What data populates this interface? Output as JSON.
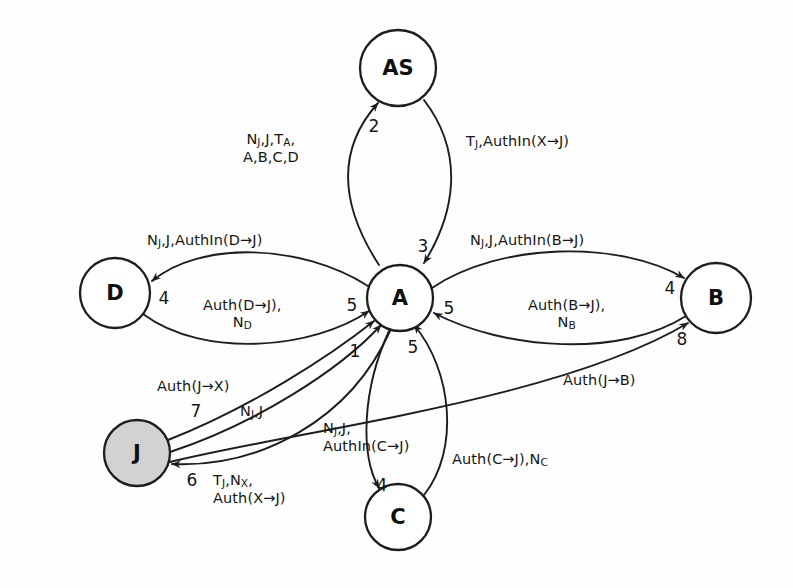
{
  "diagram": {
    "background_color": "#fefefe",
    "stroke_color": "#1d1d1d",
    "shaded_node_color": "#d2d2d2",
    "nodes": [
      {
        "id": "AS",
        "label": "AS",
        "cx": 398,
        "cy": 68,
        "r": 38,
        "shaded": false
      },
      {
        "id": "A",
        "label": "A",
        "cx": 400,
        "cy": 298,
        "r": 33,
        "shaded": false
      },
      {
        "id": "D",
        "label": "D",
        "cx": 115,
        "cy": 293,
        "r": 35,
        "shaded": false
      },
      {
        "id": "B",
        "label": "B",
        "cx": 716,
        "cy": 298,
        "r": 35,
        "shaded": false
      },
      {
        "id": "J",
        "label": "J",
        "cx": 137,
        "cy": 453,
        "r": 33,
        "shaded": true
      },
      {
        "id": "C",
        "label": "C",
        "cx": 398,
        "cy": 517,
        "r": 33,
        "shaded": false
      }
    ],
    "step_numbers": [
      {
        "id": "step-2-a-to-as",
        "text": "2",
        "x": 374,
        "y": 127
      },
      {
        "id": "step-3-as-to-a",
        "text": "3",
        "x": 423,
        "y": 247
      },
      {
        "id": "step-4-a-to-d",
        "text": "4",
        "x": 164,
        "y": 299
      },
      {
        "id": "step-5-d-to-a",
        "text": "5",
        "x": 352,
        "y": 306
      },
      {
        "id": "step-4-a-to-b",
        "text": "4",
        "x": 670,
        "y": 289
      },
      {
        "id": "step-5-b-to-a",
        "text": "5",
        "x": 449,
        "y": 309
      },
      {
        "id": "step-8-j-to-b",
        "text": "8",
        "x": 682,
        "y": 340
      },
      {
        "id": "step-1-j-to-a",
        "text": "1",
        "x": 355,
        "y": 352
      },
      {
        "id": "step-5-c-to-a",
        "text": "5",
        "x": 413,
        "y": 348
      },
      {
        "id": "step-7-j-to-a",
        "text": "7",
        "x": 196,
        "y": 412
      },
      {
        "id": "step-6-a-to-j",
        "text": "6",
        "x": 192,
        "y": 481
      },
      {
        "id": "step-4-a-to-c",
        "text": "4",
        "x": 382,
        "y": 486
      }
    ],
    "messages": [
      {
        "id": "msg-a-to-as",
        "lines": [
          "N<sub>J</sub>,J,T<sub>A</sub>,",
          "A,B,C,D"
        ],
        "x": 243,
        "y": 131,
        "align": "center"
      },
      {
        "id": "msg-as-to-a",
        "lines": [
          "T<sub>J</sub>,AuthIn(X→J)"
        ],
        "x": 466,
        "y": 133,
        "align": "left"
      },
      {
        "id": "msg-a-to-d",
        "lines": [
          "N<sub>J</sub>,J,AuthIn(D→J)"
        ],
        "x": 147,
        "y": 232,
        "align": "left"
      },
      {
        "id": "msg-d-to-a",
        "lines": [
          "Auth(D→J),",
          "N<sub>D</sub>"
        ],
        "x": 203,
        "y": 297,
        "align": "center"
      },
      {
        "id": "msg-a-to-b",
        "lines": [
          "N<sub>J</sub>,J,AuthIn(B→J)"
        ],
        "x": 470,
        "y": 232,
        "align": "left"
      },
      {
        "id": "msg-b-to-a",
        "lines": [
          "Auth(B→J),",
          "N<sub>B</sub>"
        ],
        "x": 528,
        "y": 297,
        "align": "center"
      },
      {
        "id": "msg-j-to-b",
        "lines": [
          "Auth(J→B)"
        ],
        "x": 563,
        "y": 372,
        "align": "left"
      },
      {
        "id": "msg-j-to-a-7",
        "lines": [
          "Auth(J→X)"
        ],
        "x": 157,
        "y": 378,
        "align": "left"
      },
      {
        "id": "msg-j-to-a-1",
        "lines": [
          "N<sub>J</sub>,J"
        ],
        "x": 240,
        "y": 403,
        "align": "left"
      },
      {
        "id": "msg-a-to-j-6",
        "lines": [
          "T<sub>J</sub>,N<sub>X</sub>,",
          "Auth(X→J)"
        ],
        "x": 213,
        "y": 472,
        "align": "left"
      },
      {
        "id": "msg-a-to-c",
        "lines": [
          "N<sub>J</sub>,J,",
          "AuthIn(C→J)"
        ],
        "x": 323,
        "y": 420,
        "align": "left"
      },
      {
        "id": "msg-c-to-a",
        "lines": [
          "Auth(C→J),N<sub>C</sub>"
        ],
        "x": 452,
        "y": 451,
        "align": "left"
      }
    ],
    "edges": [
      {
        "id": "edge-a-to-as",
        "from": "A",
        "to": "AS",
        "step": "2",
        "d": "M 379,265 C 340,205 336,150 378,103"
      },
      {
        "id": "edge-as-to-a",
        "from": "AS",
        "to": "A",
        "step": "3",
        "d": "M 424,100 C 466,155 454,215 424,263"
      },
      {
        "id": "edge-a-to-d",
        "from": "A",
        "to": "D",
        "step": "4",
        "d": "M 368,286 C 300,243 200,241 152,281"
      },
      {
        "id": "edge-d-to-a",
        "from": "D",
        "to": "A",
        "step": "5",
        "d": "M 143,314 C 205,360 315,348 369,311"
      },
      {
        "id": "edge-a-to-b",
        "from": "A",
        "to": "B",
        "step": "4",
        "d": "M 432,288 C 500,242 620,240 684,278"
      },
      {
        "id": "edge-b-to-a",
        "from": "B",
        "to": "A",
        "step": "5",
        "d": "M 686,316 C 620,358 505,350 434,313"
      },
      {
        "id": "edge-j-to-b",
        "from": "J",
        "to": "B",
        "step": "8",
        "d": "M 170,462 C 300,430 560,400 688,323"
      },
      {
        "id": "edge-j-to-a-7",
        "from": "J",
        "to": "A",
        "step": "7",
        "d": "M 168,440 C 250,408 330,356 374,321"
      },
      {
        "id": "edge-j-to-a-1",
        "from": "J",
        "to": "A",
        "step": "1",
        "d": "M 170,452 C 255,424 340,370 381,325"
      },
      {
        "id": "edge-a-to-j-6",
        "from": "A",
        "to": "J",
        "step": "6",
        "d": "M 390,331 C 350,420 260,468 172,464"
      },
      {
        "id": "edge-a-to-c",
        "from": "A",
        "to": "C",
        "step": "4",
        "d": "M 389,331 C 362,390 360,455 379,488"
      },
      {
        "id": "edge-c-to-a",
        "from": "C",
        "to": "A",
        "step": "5",
        "d": "M 424,495 C 460,450 452,370 414,325"
      }
    ]
  }
}
